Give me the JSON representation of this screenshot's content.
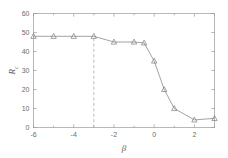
{
  "chart_data": {
    "type": "line",
    "title": "",
    "xlabel": "β",
    "ylabel": "R",
    "ylabel_sub": "c",
    "xlim": [
      -6,
      3
    ],
    "ylim": [
      0,
      60
    ],
    "xticks": [
      -6,
      -4,
      -2,
      0,
      2
    ],
    "xticklabels": [
      "-6",
      "-4",
      "-2",
      "0",
      "2"
    ],
    "xticks_minor": [
      -5,
      -3,
      -1,
      1,
      3
    ],
    "yticks": [
      0,
      10,
      20,
      30,
      40,
      50,
      60
    ],
    "yticklabels": [
      "0",
      "10",
      "20",
      "30",
      "40",
      "50",
      "60"
    ],
    "grid": false,
    "legend": null,
    "marker": "triangle-up",
    "line_color": "#8c8c8c",
    "marker_color": "#7d7d7d",
    "series": [
      {
        "name": "Rc",
        "x": [
          -6,
          -5,
          -4,
          -3,
          -2,
          -1,
          -0.5,
          0,
          0.5,
          1,
          2,
          3
        ],
        "y": [
          48,
          48,
          48,
          48,
          45,
          45,
          44.5,
          35,
          20,
          10,
          4,
          4.8
        ]
      }
    ],
    "annotations": [
      {
        "type": "vertical-dashed-line",
        "x": -3,
        "color": "#a8a8a8",
        "label": ""
      }
    ]
  }
}
